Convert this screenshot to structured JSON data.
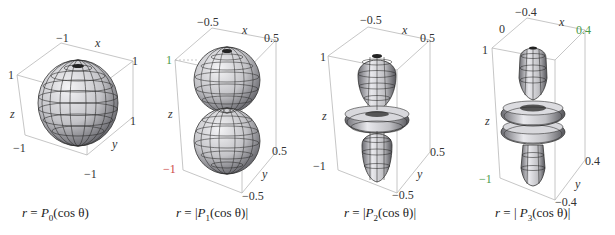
{
  "panels": [
    {
      "id": "p0",
      "caption": {
        "prefix": "r = ",
        "P": "P",
        "sub": "0",
        "arg": "(cos θ)",
        "abs": false
      },
      "x_ticks": [
        "−1",
        "1"
      ],
      "y_ticks": [
        "1",
        "−1"
      ],
      "z_ticks": [
        "1",
        "−1"
      ],
      "axis_labels": {
        "x": "x",
        "y": "y",
        "z": "z"
      },
      "shape": "sphere"
    },
    {
      "id": "p1",
      "caption": {
        "prefix": "r = ",
        "P": "P",
        "sub": "1",
        "arg": "(cos θ)",
        "abs": true
      },
      "x_ticks": [
        "−0.5",
        "0.5"
      ],
      "y_ticks": [
        "0.5",
        "−0.5"
      ],
      "z_ticks": [
        "1",
        "−1"
      ],
      "axis_labels": {
        "x": "x",
        "y": "y",
        "z": "z"
      },
      "shape": "two-lobes"
    },
    {
      "id": "p2",
      "caption": {
        "prefix": "r = ",
        "P": "P",
        "sub": "2",
        "arg": "(cos θ)",
        "abs": true
      },
      "x_ticks": [
        "−0.5",
        "0.5"
      ],
      "y_ticks": [
        "0.5",
        "−0.5"
      ],
      "z_ticks": [
        "1",
        "−1"
      ],
      "axis_labels": {
        "x": "x",
        "y": "y",
        "z": "z"
      },
      "shape": "lobes-with-torus"
    },
    {
      "id": "p3",
      "caption": {
        "prefix": "r = ",
        "P": "P",
        "sub": "3",
        "arg": "(cos θ)",
        "abs": true
      },
      "x_ticks": [
        "−0.4",
        "0.4"
      ],
      "x_extra_tick": "0",
      "y_ticks": [
        "0.4",
        "−0.4"
      ],
      "z_ticks": [
        "1",
        "−1"
      ],
      "axis_labels": {
        "x": "x",
        "y": "y",
        "z": "z"
      },
      "shape": "lobes-with-two-tori"
    }
  ],
  "colors": {
    "surface": "#c9c9cc",
    "mesh": "#2b2b2b",
    "box": "#b8b8b8",
    "tick_green": "#4a9a4a",
    "tick_red": "#c44444"
  }
}
